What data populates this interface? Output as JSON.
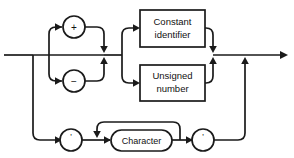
{
  "diagram": {
    "kind": "syntax-railroad-diagram",
    "title": "",
    "stroke_color": "#1a1a1a",
    "background_color": "#ffffff",
    "nodes": {
      "plus_operator": {
        "label": "+",
        "shape": "circle",
        "name": "plus-sign-node"
      },
      "minus_operator": {
        "label": "−",
        "shape": "circle",
        "name": "minus-sign-node"
      },
      "constant_identifier": {
        "label_line1": "Constant",
        "label_line2": "identifier",
        "shape": "rect",
        "name": "constant-identifier-box"
      },
      "unsigned_number": {
        "label_line1": "Unsigned",
        "label_line2": "number",
        "shape": "rect",
        "name": "unsigned-number-box"
      },
      "open_quote": {
        "label": "'",
        "shape": "circle",
        "name": "opening-quote-node"
      },
      "character": {
        "label": "Character",
        "shape": "stadium",
        "name": "character-node"
      },
      "close_quote": {
        "label": "'",
        "shape": "circle",
        "name": "closing-quote-node"
      }
    },
    "paths": {
      "entry_rail": "M 4 55 L 33 55",
      "sign_branch_up": "M 33 55 L 57 55 L 57 30 L 62 26",
      "sign_branch_down": "M 33 55 L 57 55 L 57 78 L 62 82",
      "plus_merge": "M 90 26 L 104 26 L 104 50",
      "minus_merge": "M 90 78 L 104 78 L 104 60",
      "sign_bypass": "M 33 55 L 104 55",
      "after_sign": "M 110 55 L 122 55",
      "to_constant_up": "M 122 55 L 122 28 L 136 28",
      "to_unsigned_down": "M 122 55 L 122 83 L 136 83",
      "constant_out": "M 205 28 L 213 28 L 213 50",
      "unsigned_out": "M 205 83 L 213 83 L 213 60",
      "exit_rail": "M 213 55 L 285 55",
      "lower_drop": "M 33 55 L 33 140 L 60 140",
      "open_quote_to_loop": "M 82 140 L 97 140",
      "loop_entry": "M 97 140 L 109 140",
      "loop_back_top": "M 180 140 L 180 122 L 97 122 L 97 134",
      "character_to_close": "M 172 140 L 190 140",
      "close_quote_exit": "M 212 140 L 245 140 L 245 60"
    },
    "arrowheads": [
      {
        "x": 64,
        "y": 26,
        "dir": "right",
        "name": "arrow-into-plus"
      },
      {
        "x": 64,
        "y": 80,
        "dir": "right",
        "name": "arrow-into-minus"
      },
      {
        "x": 104,
        "y": 53,
        "dir": "down",
        "name": "arrow-plus-merge"
      },
      {
        "x": 104,
        "y": 57,
        "dir": "up",
        "name": "arrow-minus-merge"
      },
      {
        "x": 138,
        "y": 28,
        "dir": "right",
        "name": "arrow-into-constant"
      },
      {
        "x": 138,
        "y": 83,
        "dir": "right",
        "name": "arrow-into-unsigned"
      },
      {
        "x": 213,
        "y": 53,
        "dir": "down",
        "name": "arrow-constant-merge"
      },
      {
        "x": 213,
        "y": 57,
        "dir": "up",
        "name": "arrow-unsigned-merge"
      },
      {
        "x": 285,
        "y": 55,
        "dir": "right",
        "name": "arrow-exit"
      },
      {
        "x": 62,
        "y": 140,
        "dir": "right",
        "name": "arrow-into-open-quote"
      },
      {
        "x": 110,
        "y": 140,
        "dir": "right",
        "name": "arrow-into-character"
      },
      {
        "x": 97,
        "y": 136,
        "dir": "down",
        "name": "arrow-loop-back"
      },
      {
        "x": 192,
        "y": 140,
        "dir": "right",
        "name": "arrow-into-close-quote"
      },
      {
        "x": 245,
        "y": 60,
        "dir": "up",
        "name": "arrow-lower-merge"
      }
    ]
  }
}
